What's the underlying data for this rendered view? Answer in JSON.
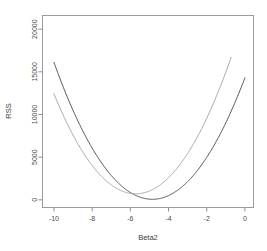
{
  "chart_data": {
    "type": "line",
    "title": "",
    "subtitle": "",
    "xlabel": "Beta2",
    "ylabel": "RSS",
    "xlim": [
      -10.6,
      0.45
    ],
    "ylim": [
      -900,
      21600
    ],
    "grid": false,
    "legend": null,
    "xticks": [
      -10,
      -8,
      -6,
      -4,
      -2,
      0
    ],
    "xticklabels": [
      "-10",
      "-8",
      "-6",
      "-4",
      "-2",
      "0"
    ],
    "yticks": [
      0,
      5000,
      10000,
      15000,
      20000
    ],
    "yticklabels": [
      "0",
      "5000",
      "10000",
      "15000",
      "20000"
    ],
    "series": [
      {
        "name": "curve-dark",
        "color": "#555555",
        "vertex_x": -4.85,
        "vertex_y": 60,
        "curvature": 605,
        "x_start": -10.0,
        "x_end": 0.0,
        "x": [
          -10,
          -9.5,
          -9,
          -8.5,
          -8,
          -7.5,
          -7,
          -6.5,
          -6,
          -5.5,
          -5,
          -4.85,
          -4.5,
          -4,
          -3.5,
          -3,
          -2.5,
          -2,
          -1.5,
          -1,
          -0.5,
          0
        ],
        "y": [
          20460,
          17590,
          14930,
          12470,
          10220,
          8180,
          6340,
          4710,
          3280,
          2060,
          1040,
          60,
          130,
          500,
          1130,
          2020,
          3160,
          4550,
          6190,
          8080,
          10220,
          14300
        ]
      },
      {
        "name": "curve-light",
        "color": "#a8a8a8",
        "vertex_x": -5.72,
        "vertex_y": 700,
        "curvature": 640,
        "x_start": -10.0,
        "x_end": -0.72,
        "x": [
          -10,
          -9.5,
          -9,
          -8.5,
          -8,
          -7.5,
          -7,
          -6.5,
          -6,
          -5.72,
          -5.5,
          -5,
          -4.5,
          -4,
          -3.5,
          -3,
          -2.5,
          -2,
          -1.5,
          -1,
          -0.72
        ],
        "y": [
          11770,
          9850,
          8150,
          6650,
          5360,
          4280,
          3400,
          2730,
          2270,
          700,
          2060,
          2470,
          3190,
          4190,
          5460,
          7000,
          8800,
          10860,
          13180,
          15750,
          21500
        ]
      }
    ]
  },
  "axis": {
    "x_title": "Beta2",
    "y_title": "RSS"
  }
}
